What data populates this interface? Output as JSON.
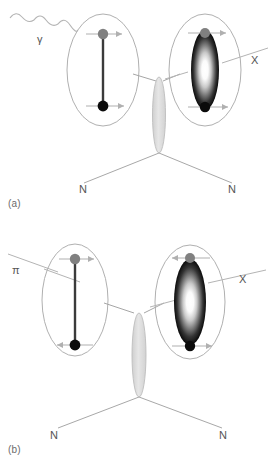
{
  "figure": {
    "width": 273,
    "height": 466
  },
  "colors": {
    "background": "#ffffff",
    "outline": "#9a9a9a",
    "line": "#8e8e8e",
    "quark_gray": "#808080",
    "quark_black": "#0b0b0b",
    "rod": "#333333",
    "lens_fill": "#dcdcdc",
    "lens_stroke": "#b5b5b5",
    "arrow": "#a8a8a8",
    "text": "#555555",
    "blob_center": "#ffffff",
    "blob_edge": "#000000"
  },
  "panels": [
    {
      "id": "a",
      "label": "(a)",
      "incoming": {
        "name": "photon",
        "label": "γ",
        "style": "wavy"
      },
      "outgoing": {
        "name": "meson",
        "label": "X",
        "style": "straight"
      },
      "nucleons": [
        {
          "label": "N",
          "side": "left"
        },
        {
          "label": "N",
          "side": "right"
        }
      ],
      "left_blob": {
        "type": "rod-dipole",
        "top_quark_color": "gray",
        "bottom_quark_color": "black",
        "top_arrow_direction": "right",
        "bottom_arrow_direction": "right"
      },
      "right_blob": {
        "type": "gradient-ellipse",
        "top_quark_color": "gray",
        "bottom_quark_color": "black",
        "top_arrow_direction": "right",
        "bottom_arrow_direction": "right"
      },
      "exchange": {
        "name": "exchange-lens",
        "shape": "narrow-vertical-lens"
      }
    },
    {
      "id": "b",
      "label": "(b)",
      "incoming": {
        "name": "pion",
        "label": "π",
        "style": "straight"
      },
      "outgoing": {
        "name": "meson",
        "label": "X",
        "style": "straight"
      },
      "nucleons": [
        {
          "label": "N",
          "side": "left"
        },
        {
          "label": "N",
          "side": "right"
        }
      ],
      "left_blob": {
        "type": "rod-dipole",
        "top_quark_color": "gray",
        "bottom_quark_color": "black",
        "top_arrow_direction": "right",
        "bottom_arrow_direction": "left"
      },
      "right_blob": {
        "type": "gradient-ellipse",
        "top_quark_color": "gray",
        "bottom_quark_color": "black",
        "top_arrow_direction": "left",
        "bottom_arrow_direction": "right"
      },
      "exchange": {
        "name": "exchange-lens",
        "shape": "narrow-vertical-lens"
      }
    }
  ]
}
